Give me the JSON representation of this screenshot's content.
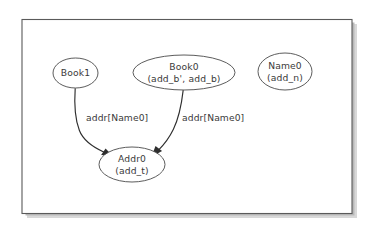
{
  "diagram": {
    "kind": "instance-graph",
    "background_color": "#ffffff",
    "frame": {
      "border_color": "#5a5a5a",
      "fill_color": "#ffffff",
      "shadow_color": "#b9b9b9"
    },
    "node_style": {
      "shape": "ellipse",
      "fill_color": "#ffffff",
      "stroke_color": "#4a4a4a",
      "text_color": "#3a3a3a"
    },
    "edge_style": {
      "stroke_color": "#2e2e2e",
      "arrow": "filled-triangle"
    },
    "nodes": [
      {
        "id": "book1",
        "name": "Book1",
        "lines": [
          "Book1"
        ],
        "cx": 75.5,
        "cy": 73,
        "rx": 22.5,
        "ry": 15
      },
      {
        "id": "book0",
        "name": "Book0",
        "lines": [
          "Book0",
          "(add_b', add_b)"
        ],
        "cx": 184,
        "cy": 72.5,
        "rx": 51,
        "ry": 17.5
      },
      {
        "id": "name0",
        "name": "Name0",
        "lines": [
          "Name0",
          "(add_n)"
        ],
        "cx": 285,
        "cy": 71.5,
        "rx": 27,
        "ry": 18.5
      },
      {
        "id": "addr0",
        "name": "Addr0",
        "lines": [
          "Addr0",
          "(add_t)"
        ],
        "cx": 132,
        "cy": 164.5,
        "rx": 33,
        "ry": 17.5
      }
    ],
    "edges": [
      {
        "id": "edge-book1-addr0",
        "from": "book1",
        "to": "addr0",
        "label": "addr[Name0]",
        "label_x": 86,
        "label_y": 118,
        "label_anchor": "start"
      },
      {
        "id": "edge-book0-addr0",
        "from": "book0",
        "to": "addr0",
        "label": "addr[Name0]",
        "label_x": 182,
        "label_y": 118,
        "label_anchor": "start"
      }
    ]
  }
}
